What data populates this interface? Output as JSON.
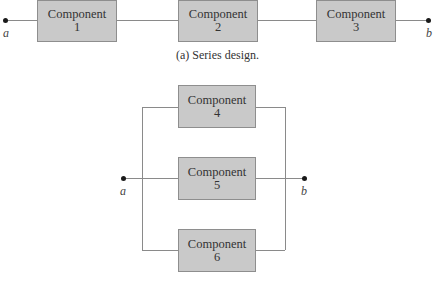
{
  "series": {
    "node_a": "a",
    "node_b": "b",
    "components": [
      {
        "name": "Component",
        "number": "1"
      },
      {
        "name": "Component",
        "number": "2"
      },
      {
        "name": "Component",
        "number": "3"
      }
    ],
    "caption": "(a) Series design."
  },
  "parallel": {
    "node_a": "a",
    "node_b": "b",
    "components": [
      {
        "name": "Component",
        "number": "4"
      },
      {
        "name": "Component",
        "number": "5"
      },
      {
        "name": "Component",
        "number": "6"
      }
    ]
  },
  "colors": {
    "box_fill": "#c9c9c9",
    "box_border": "#8e8e8e",
    "wire": "#8a8a8a",
    "terminal": "#1a1a1a"
  }
}
